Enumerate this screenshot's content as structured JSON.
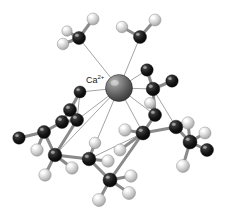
{
  "figure": {
    "kind": "molecular-structure-3d",
    "title_label": "Ca",
    "charge_label": "2+",
    "background_color": "#ffffff",
    "width": 227,
    "height": 224
  },
  "legend": {
    "metal_color": "#5a5a5a",
    "carbon_color": "#161616",
    "hydrogen_color": "#d8d8d8",
    "bond_color": "#8a8a8a",
    "coordination_bond_color": "#9a9a9a"
  },
  "label": {
    "text": "Ca",
    "superscript": "2+",
    "x": 86,
    "y": 74
  },
  "chart_data": {
    "type": "scatter",
    "xlabel": "",
    "ylabel": "",
    "xlim": [
      0,
      227
    ],
    "ylim": [
      0,
      224
    ],
    "grid": false,
    "legend": "none",
    "atoms": [
      {
        "id": "Ca",
        "element": "Ca",
        "x": 119,
        "y": 88,
        "r": 13.5,
        "color": "#5a5a5a",
        "z": 10
      },
      {
        "id": "C1",
        "element": "C",
        "x": 79,
        "y": 38,
        "r": 6.5,
        "color": "#161616",
        "z": 6
      },
      {
        "id": "H1a",
        "element": "H",
        "x": 93,
        "y": 19,
        "r": 6.0,
        "color": "#d8d8d8",
        "z": 5
      },
      {
        "id": "H1b",
        "element": "H",
        "x": 63,
        "y": 44,
        "r": 5.8,
        "color": "#d8d8d8",
        "z": 5
      },
      {
        "id": "H1c",
        "element": "H",
        "x": 67,
        "y": 31,
        "r": 5.2,
        "color": "#cfcfcf",
        "z": 4
      },
      {
        "id": "C2",
        "element": "C",
        "x": 140,
        "y": 37,
        "r": 6.5,
        "color": "#161616",
        "z": 6
      },
      {
        "id": "H2a",
        "element": "H",
        "x": 155,
        "y": 20,
        "r": 6.0,
        "color": "#d8d8d8",
        "z": 5
      },
      {
        "id": "H2b",
        "element": "H",
        "x": 122,
        "y": 27,
        "r": 5.8,
        "color": "#d8d8d8",
        "z": 5
      },
      {
        "id": "C3",
        "element": "C",
        "x": 153,
        "y": 89,
        "r": 6.8,
        "color": "#1b1b1b",
        "z": 7
      },
      {
        "id": "C3a",
        "element": "C",
        "x": 147,
        "y": 70,
        "r": 6.2,
        "color": "#202020",
        "z": 6
      },
      {
        "id": "C3b",
        "element": "C",
        "x": 172,
        "y": 81,
        "r": 6.2,
        "color": "#242424",
        "z": 6
      },
      {
        "id": "C4",
        "element": "C",
        "x": 80,
        "y": 92,
        "r": 6.0,
        "color": "#1a1a1a",
        "z": 6
      },
      {
        "id": "C5",
        "element": "C",
        "x": 70,
        "y": 110,
        "r": 6.5,
        "color": "#161616",
        "z": 6
      },
      {
        "id": "C6",
        "element": "C",
        "x": 62,
        "y": 122,
        "r": 6.5,
        "color": "#161616",
        "z": 6
      },
      {
        "id": "C7",
        "element": "C",
        "x": 77,
        "y": 120,
        "r": 6.5,
        "color": "#171717",
        "z": 7
      },
      {
        "id": "C8",
        "element": "C",
        "x": 44,
        "y": 132,
        "r": 6.5,
        "color": "#141414",
        "z": 6
      },
      {
        "id": "C9",
        "element": "C",
        "x": 19,
        "y": 138,
        "r": 6.2,
        "color": "#181818",
        "z": 5
      },
      {
        "id": "H9",
        "element": "H",
        "x": 37,
        "y": 150,
        "r": 6.2,
        "color": "#d4d4d4",
        "z": 5
      },
      {
        "id": "C10",
        "element": "C",
        "x": 55,
        "y": 155,
        "r": 6.8,
        "color": "#121212",
        "z": 7
      },
      {
        "id": "H10a",
        "element": "H",
        "x": 45,
        "y": 175,
        "r": 6.2,
        "color": "#d8d8d8",
        "z": 5
      },
      {
        "id": "H10b",
        "element": "H",
        "x": 72,
        "y": 168,
        "r": 6.2,
        "color": "#d2d2d2",
        "z": 5
      },
      {
        "id": "C11",
        "element": "C",
        "x": 89,
        "y": 159,
        "r": 6.8,
        "color": "#101010",
        "z": 8
      },
      {
        "id": "H11a",
        "element": "H",
        "x": 108,
        "y": 161,
        "r": 6.2,
        "color": "#dcdcdc",
        "z": 6
      },
      {
        "id": "H11b",
        "element": "H",
        "x": 95,
        "y": 143,
        "r": 5.8,
        "color": "#d4d4d4",
        "z": 5
      },
      {
        "id": "C12",
        "element": "C",
        "x": 110,
        "y": 180,
        "r": 7.0,
        "color": "#0c0c0c",
        "z": 9
      },
      {
        "id": "H12a",
        "element": "H",
        "x": 99,
        "y": 200,
        "r": 6.5,
        "color": "#d8d8d8",
        "z": 6
      },
      {
        "id": "H12b",
        "element": "H",
        "x": 129,
        "y": 193,
        "r": 6.5,
        "color": "#dcdcdc",
        "z": 6
      },
      {
        "id": "H12c",
        "element": "H",
        "x": 131,
        "y": 176,
        "r": 6.2,
        "color": "#d0d0d0",
        "z": 5
      },
      {
        "id": "C13",
        "element": "C",
        "x": 143,
        "y": 133,
        "r": 7.0,
        "color": "#121212",
        "z": 8
      },
      {
        "id": "H13",
        "element": "H",
        "x": 125,
        "y": 130,
        "r": 6.2,
        "color": "#cfcfcf",
        "z": 5
      },
      {
        "id": "H13b",
        "element": "H",
        "x": 120,
        "y": 150,
        "r": 6.0,
        "color": "#bfbfbf",
        "z": 5
      },
      {
        "id": "C14",
        "element": "C",
        "x": 155,
        "y": 115,
        "r": 6.5,
        "color": "#171717",
        "z": 6
      },
      {
        "id": "C15",
        "element": "C",
        "x": 176,
        "y": 127,
        "r": 6.8,
        "color": "#141414",
        "z": 7
      },
      {
        "id": "C16",
        "element": "C",
        "x": 190,
        "y": 142,
        "r": 7.0,
        "color": "#0e0e0e",
        "z": 8
      },
      {
        "id": "H16a",
        "element": "H",
        "x": 188,
        "y": 123,
        "r": 6.2,
        "color": "#dcdcdc",
        "z": 6
      },
      {
        "id": "H16b",
        "element": "H",
        "x": 205,
        "y": 133,
        "r": 6.0,
        "color": "#d0d0d0",
        "z": 5
      },
      {
        "id": "C17",
        "element": "C",
        "x": 207,
        "y": 150,
        "r": 6.5,
        "color": "#1a1a1a",
        "z": 6
      },
      {
        "id": "H17",
        "element": "H",
        "x": 183,
        "y": 166,
        "r": 6.5,
        "color": "#d8d8d8",
        "z": 6
      },
      {
        "id": "H18",
        "element": "H",
        "x": 150,
        "y": 103,
        "r": 5.5,
        "color": "#cacaca",
        "z": 5
      }
    ],
    "bonds": [
      {
        "from": "C1",
        "to": "H1a",
        "kind": "covalent"
      },
      {
        "from": "C1",
        "to": "H1b",
        "kind": "covalent"
      },
      {
        "from": "C1",
        "to": "H1c",
        "kind": "covalent"
      },
      {
        "from": "C2",
        "to": "H2a",
        "kind": "covalent"
      },
      {
        "from": "C2",
        "to": "H2b",
        "kind": "covalent"
      },
      {
        "from": "C3",
        "to": "C3a",
        "kind": "covalent"
      },
      {
        "from": "C3",
        "to": "C3b",
        "kind": "covalent"
      },
      {
        "from": "C3",
        "to": "C14",
        "kind": "covalent"
      },
      {
        "from": "C4",
        "to": "C5",
        "kind": "covalent"
      },
      {
        "from": "C5",
        "to": "C6",
        "kind": "covalent"
      },
      {
        "from": "C6",
        "to": "C7",
        "kind": "covalent"
      },
      {
        "from": "C6",
        "to": "C8",
        "kind": "covalent"
      },
      {
        "from": "C8",
        "to": "C9",
        "kind": "covalent"
      },
      {
        "from": "C8",
        "to": "H9",
        "kind": "covalent"
      },
      {
        "from": "C8",
        "to": "C10",
        "kind": "covalent"
      },
      {
        "from": "C7",
        "to": "C10",
        "kind": "covalent"
      },
      {
        "from": "C10",
        "to": "H10a",
        "kind": "covalent"
      },
      {
        "from": "C10",
        "to": "H10b",
        "kind": "covalent"
      },
      {
        "from": "C10",
        "to": "C11",
        "kind": "covalent"
      },
      {
        "from": "C11",
        "to": "H11a",
        "kind": "covalent"
      },
      {
        "from": "C11",
        "to": "H11b",
        "kind": "covalent"
      },
      {
        "from": "C11",
        "to": "C12",
        "kind": "covalent"
      },
      {
        "from": "C12",
        "to": "H12a",
        "kind": "covalent"
      },
      {
        "from": "C12",
        "to": "H12b",
        "kind": "covalent"
      },
      {
        "from": "C12",
        "to": "H12c",
        "kind": "covalent"
      },
      {
        "from": "C12",
        "to": "C13",
        "kind": "covalent"
      },
      {
        "from": "C13",
        "to": "H13",
        "kind": "covalent"
      },
      {
        "from": "C13",
        "to": "H13b",
        "kind": "covalent"
      },
      {
        "from": "C13",
        "to": "C14",
        "kind": "covalent"
      },
      {
        "from": "C13",
        "to": "C15",
        "kind": "covalent"
      },
      {
        "from": "C14",
        "to": "H18",
        "kind": "covalent"
      },
      {
        "from": "C15",
        "to": "C16",
        "kind": "covalent"
      },
      {
        "from": "C16",
        "to": "H16a",
        "kind": "covalent"
      },
      {
        "from": "C16",
        "to": "H16b",
        "kind": "covalent"
      },
      {
        "from": "C16",
        "to": "C17",
        "kind": "covalent"
      },
      {
        "from": "C16",
        "to": "H17",
        "kind": "covalent"
      },
      {
        "from": "Ca",
        "to": "C1",
        "kind": "coordination"
      },
      {
        "from": "Ca",
        "to": "C2",
        "kind": "coordination"
      },
      {
        "from": "Ca",
        "to": "C3a",
        "kind": "coordination"
      },
      {
        "from": "Ca",
        "to": "C3",
        "kind": "coordination"
      },
      {
        "from": "Ca",
        "to": "C4",
        "kind": "coordination"
      },
      {
        "from": "Ca",
        "to": "C7",
        "kind": "coordination"
      },
      {
        "from": "Ca",
        "to": "C10",
        "kind": "coordination"
      },
      {
        "from": "Ca",
        "to": "C11",
        "kind": "coordination"
      },
      {
        "from": "Ca",
        "to": "C13",
        "kind": "coordination"
      },
      {
        "from": "Ca",
        "to": "C14",
        "kind": "coordination"
      },
      {
        "from": "C4",
        "to": "C7",
        "kind": "coordination"
      },
      {
        "from": "C11",
        "to": "C13",
        "kind": "coordination"
      },
      {
        "from": "C3",
        "to": "C15",
        "kind": "coordination"
      }
    ]
  }
}
